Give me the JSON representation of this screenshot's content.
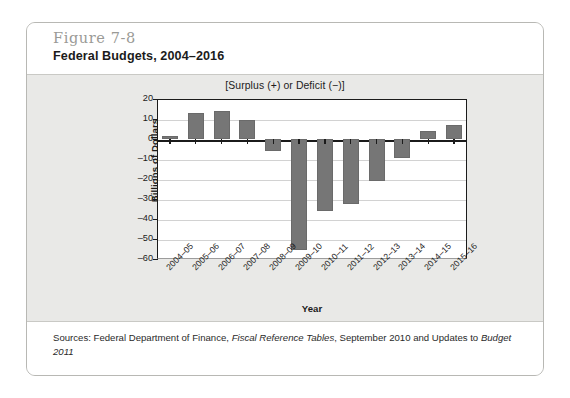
{
  "figure": {
    "number": "Figure 7-8",
    "title": "Federal Budgets, 2004–2016"
  },
  "source": {
    "prefix": "Sources: Federal Department of Finance, ",
    "italic_1": "Fiscal Reference Tables",
    "middle": ", September 2010 and Updates to ",
    "italic_2": "Budget 2011"
  },
  "chart_data": {
    "type": "bar",
    "title": "[Surplus (+) or Deficit (−)]",
    "xlabel": "Year",
    "ylabel": "Billions of Dollars",
    "categories": [
      "2004–05",
      "2005–06",
      "2006–07",
      "2007–08",
      "2008–09",
      "2009–10",
      "2010–11",
      "2011–12",
      "2012–13",
      "2013–14",
      "2014–15",
      "2015–16"
    ],
    "values": [
      1.5,
      13.2,
      13.8,
      9.6,
      -5.8,
      -55.6,
      -36.2,
      -32.3,
      -21.1,
      -9.6,
      3.8,
      7.0
    ],
    "ylim": [
      -60,
      20
    ],
    "yticks": [
      20,
      10,
      0,
      -10,
      -20,
      -30,
      -40,
      -50,
      -60
    ],
    "ytick_labels": [
      "20",
      "10",
      "0",
      "–10",
      "–20",
      "–30",
      "–40",
      "–50",
      "–60"
    ],
    "grid": true,
    "legend": "none",
    "bar_color": "#767676",
    "zero_line_color": "#1b1b1b",
    "plot_background": "#ffffff"
  }
}
